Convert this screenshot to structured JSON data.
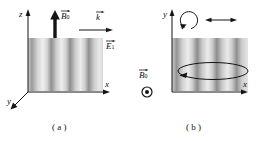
{
  "figure": {
    "type": "physics-diagram",
    "background_color": "#ffffff",
    "ink_color": "#141414"
  },
  "panels": [
    {
      "id": "a",
      "caption": "( a )",
      "axes": [
        {
          "name": "z",
          "label": "z",
          "direction": "up"
        },
        {
          "name": "x",
          "label": "x",
          "direction": "right"
        },
        {
          "name": "y",
          "label": "y",
          "direction": "down-left"
        }
      ],
      "vectors": [
        {
          "name": "B0",
          "symbol": "B",
          "subscript": "0",
          "label": "B⃗0",
          "style": "thick-up-arrow",
          "direction": "up"
        },
        {
          "name": "k",
          "symbol": "k",
          "subscript": "",
          "label": "k⃗",
          "style": "thin-right-arrow",
          "direction": "right"
        },
        {
          "name": "E1",
          "symbol": "E",
          "subscript": "1",
          "label": "E⃗1",
          "style": "label-only",
          "direction": ""
        }
      ],
      "field_region": {
        "name": "standing-wave-stripes",
        "orientation": "vertical-bands",
        "band_count": 4,
        "light_color": "#ededed",
        "dark_color": "#8c8c8c"
      }
    },
    {
      "id": "b",
      "caption": "( b )",
      "axes": [
        {
          "name": "y",
          "label": "y",
          "direction": "up"
        },
        {
          "name": "x",
          "label": "x",
          "direction": "right"
        }
      ],
      "vectors": [
        {
          "name": "B0",
          "symbol": "B",
          "subscript": "0",
          "label": "B⃗0",
          "style": "out-of-page",
          "direction": "out-of-page"
        }
      ],
      "symbols": [
        {
          "name": "circle-dot-icon",
          "glyph": "⊙",
          "meaning": "out-of-page"
        },
        {
          "name": "circular-arrow-icon",
          "glyph": "↻",
          "meaning": "circular-polarization"
        },
        {
          "name": "double-arrow-icon",
          "glyph": "↔",
          "meaning": "linear-oscillation"
        },
        {
          "name": "ellipse-orbit-icon",
          "glyph": "ellipse",
          "meaning": "precession-orbit"
        }
      ],
      "field_region": {
        "name": "standing-wave-stripes",
        "orientation": "vertical-bands",
        "band_count": 4,
        "light_color": "#ebebeb",
        "dark_color": "#8c8c8c"
      }
    }
  ]
}
